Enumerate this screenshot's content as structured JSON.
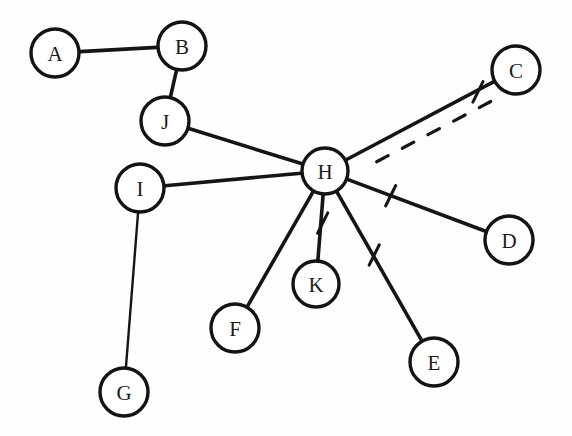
{
  "diagram": {
    "background_color": "#fefefe",
    "stroke_color": "#151515",
    "node_fill_color": "#ffffff",
    "width": 572,
    "height": 436,
    "nodes": [
      {
        "id": "A",
        "label": "A",
        "cx": 55,
        "cy": 53,
        "r": 24
      },
      {
        "id": "B",
        "label": "B",
        "cx": 182,
        "cy": 46,
        "r": 24
      },
      {
        "id": "C",
        "label": "C",
        "cx": 516,
        "cy": 70,
        "r": 24
      },
      {
        "id": "D",
        "label": "D",
        "cx": 509,
        "cy": 240,
        "r": 24
      },
      {
        "id": "E",
        "label": "E",
        "cx": 434,
        "cy": 362,
        "r": 24
      },
      {
        "id": "F",
        "label": "F",
        "cx": 235,
        "cy": 328,
        "r": 24
      },
      {
        "id": "G",
        "label": "G",
        "cx": 124,
        "cy": 392,
        "r": 24
      },
      {
        "id": "H",
        "label": "H",
        "cx": 325,
        "cy": 171,
        "r": 23
      },
      {
        "id": "I",
        "label": "I",
        "cx": 140,
        "cy": 188,
        "r": 24
      },
      {
        "id": "J",
        "label": "J",
        "cx": 165,
        "cy": 121,
        "r": 24
      },
      {
        "id": "K",
        "label": "K",
        "cx": 316,
        "cy": 284,
        "r": 23
      }
    ],
    "edges": [
      {
        "id": "A-B",
        "source": "A",
        "target": "B",
        "style": "solid",
        "weight": "thick",
        "tick": false
      },
      {
        "id": "B-J",
        "source": "B",
        "target": "J",
        "style": "solid",
        "weight": "thick",
        "tick": false
      },
      {
        "id": "J-H",
        "source": "J",
        "target": "H",
        "style": "solid",
        "weight": "thick",
        "tick": false
      },
      {
        "id": "I-H",
        "source": "I",
        "target": "H",
        "style": "solid",
        "weight": "thick",
        "tick": false
      },
      {
        "id": "I-G",
        "source": "I",
        "target": "G",
        "style": "solid",
        "weight": "thin",
        "tick": false
      },
      {
        "id": "H-C",
        "source": "H",
        "target": "C",
        "style": "solid",
        "weight": "thick",
        "tick": true
      },
      {
        "id": "H-D",
        "source": "H",
        "target": "D",
        "style": "solid",
        "weight": "thick",
        "tick": true
      },
      {
        "id": "H-E",
        "source": "H",
        "target": "E",
        "style": "solid",
        "weight": "thick",
        "tick": true
      },
      {
        "id": "H-K",
        "source": "H",
        "target": "K",
        "style": "solid",
        "weight": "thick",
        "tick": true
      },
      {
        "id": "H-F",
        "source": "H",
        "target": "F",
        "style": "solid",
        "weight": "thick",
        "tick": false
      },
      {
        "id": "H-C-dashed",
        "source": "H",
        "target": "C",
        "style": "dashed",
        "weight": "thick",
        "tick": false,
        "offset": 16
      }
    ]
  }
}
